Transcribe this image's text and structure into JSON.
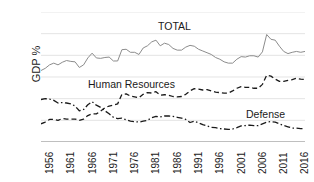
{
  "chart_data": {
    "type": "line",
    "title": "",
    "xlabel": "",
    "ylabel": "GDP %",
    "xlim": [
      1956,
      2018
    ],
    "ylim": [
      0,
      30
    ],
    "grid": true,
    "legend_position": "inline-annotations",
    "x_tick_labels": [
      "1956",
      "1961",
      "1966",
      "1971",
      "1976",
      "1981",
      "1986",
      "1991",
      "1996",
      "2001",
      "2006",
      "2011",
      "2016"
    ],
    "y_tick_labels": [
      "0",
      "5",
      "10",
      "15",
      "20",
      "25",
      "30"
    ],
    "y_ticks": [
      0,
      5,
      10,
      15,
      20,
      25,
      30
    ],
    "x": [
      1956,
      1957,
      1958,
      1959,
      1960,
      1961,
      1962,
      1963,
      1964,
      1965,
      1966,
      1967,
      1968,
      1969,
      1970,
      1971,
      1972,
      1973,
      1974,
      1975,
      1976,
      1977,
      1978,
      1979,
      1980,
      1981,
      1982,
      1983,
      1984,
      1985,
      1986,
      1987,
      1988,
      1989,
      1990,
      1991,
      1992,
      1993,
      1994,
      1995,
      1996,
      1997,
      1998,
      1999,
      2000,
      2001,
      2002,
      2003,
      2004,
      2005,
      2006,
      2007,
      2008,
      2009,
      2010,
      2011,
      2012,
      2013,
      2014,
      2015,
      2016,
      2017,
      2018
    ],
    "series": [
      {
        "name": "TOTAL",
        "style": "solid",
        "color": "#8c8c8c",
        "label_text": "TOTAL",
        "values": [
          16.5,
          17.0,
          17.8,
          18.2,
          17.8,
          18.4,
          18.8,
          18.6,
          18.5,
          17.2,
          17.8,
          19.4,
          20.5,
          19.4,
          19.3,
          19.5,
          19.6,
          18.7,
          18.7,
          21.3,
          21.4,
          20.7,
          20.7,
          20.2,
          21.7,
          22.2,
          23.1,
          23.5,
          22.2,
          22.8,
          22.5,
          21.6,
          21.2,
          21.2,
          21.9,
          22.3,
          22.1,
          21.4,
          21.0,
          20.6,
          20.2,
          19.5,
          19.1,
          18.5,
          18.2,
          18.2,
          19.1,
          19.7,
          19.6,
          19.9,
          19.9,
          19.6,
          20.8,
          24.8,
          23.7,
          23.5,
          22.1,
          20.9,
          20.4,
          20.7,
          20.9,
          20.7,
          20.9
        ]
      },
      {
        "name": "Human Resources",
        "style": "dashed",
        "color": "#1a1a1a",
        "label_text": "Human Resources",
        "values": [
          4.2,
          4.6,
          5.2,
          5.2,
          5.0,
          5.4,
          5.3,
          5.3,
          5.3,
          5.0,
          5.3,
          6.1,
          6.5,
          6.5,
          7.1,
          7.9,
          8.3,
          8.5,
          8.8,
          11.0,
          11.1,
          10.6,
          10.4,
          10.2,
          11.0,
          11.4,
          11.3,
          11.6,
          10.8,
          10.9,
          10.8,
          10.5,
          10.4,
          10.5,
          11.0,
          11.8,
          12.3,
          12.2,
          12.0,
          12.1,
          11.8,
          11.5,
          11.4,
          11.3,
          11.3,
          11.8,
          12.4,
          12.8,
          12.6,
          12.6,
          12.4,
          12.4,
          13.3,
          15.4,
          15.2,
          14.5,
          14.0,
          14.0,
          14.2,
          14.4,
          14.7,
          14.5,
          14.4
        ]
      },
      {
        "name": "Defense",
        "style": "dashdot",
        "color": "#1a1a1a",
        "label_text": "Defense",
        "values": [
          9.8,
          10.0,
          9.9,
          9.6,
          9.0,
          9.1,
          9.0,
          8.8,
          8.3,
          7.2,
          7.5,
          8.6,
          9.3,
          8.5,
          8.0,
          7.2,
          6.5,
          5.7,
          5.4,
          5.5,
          5.1,
          4.8,
          4.7,
          4.6,
          4.8,
          5.0,
          5.6,
          5.9,
          5.8,
          6.0,
          6.0,
          5.9,
          5.7,
          5.5,
          5.2,
          4.5,
          4.8,
          4.4,
          4.0,
          3.7,
          3.4,
          3.3,
          3.1,
          3.0,
          2.9,
          3.0,
          3.3,
          3.7,
          3.8,
          3.9,
          3.8,
          3.8,
          4.2,
          4.6,
          4.7,
          4.6,
          4.2,
          3.8,
          3.5,
          3.2,
          3.2,
          3.1,
          3.1
        ]
      }
    ]
  }
}
